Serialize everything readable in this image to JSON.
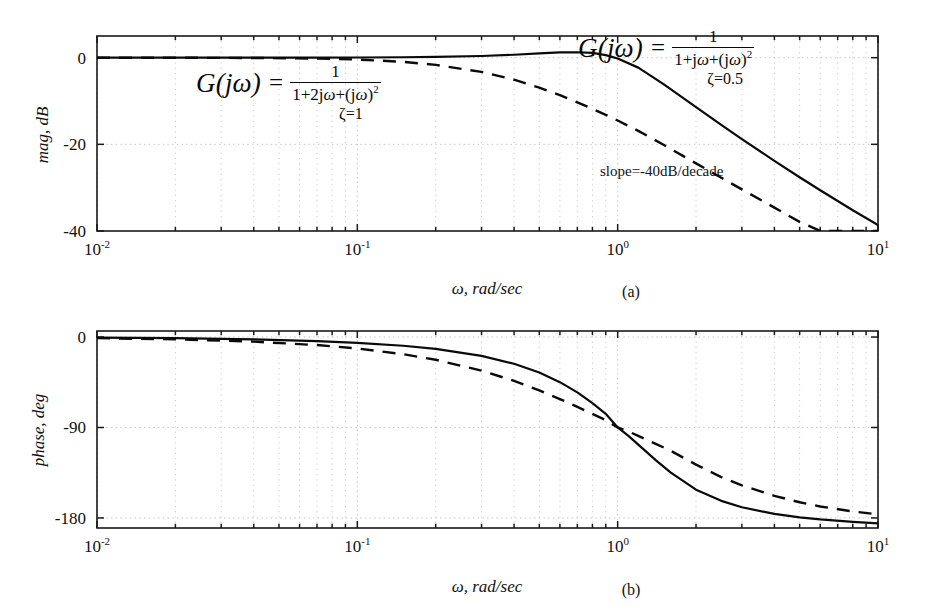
{
  "figure": {
    "caption_a": "(a)",
    "caption_b": "(b)"
  },
  "annotations": {
    "slope_note": "slope=-40dB/decade",
    "formula_left": {
      "lhs": "G(jω)",
      "equals": "=",
      "numerator": "1",
      "denominator_prefix": "1+2j",
      "denominator_omega": "ω",
      "denominator_mid": "+(j",
      "denominator_omega2": "ω",
      "denominator_suffix": ")",
      "denominator_exp": "2",
      "damping": "ζ=1"
    },
    "formula_right": {
      "lhs": "G(jω)",
      "equals": "=",
      "numerator": "1",
      "denominator_prefix": "1+j",
      "denominator_omega": "ω",
      "denominator_mid": "+(j",
      "denominator_omega2": "ω",
      "denominator_suffix": ")",
      "denominator_exp": "2",
      "damping": "ζ=0.5"
    }
  },
  "chart_data": [
    {
      "type": "line",
      "id": "magnitude-plot",
      "title": "",
      "xlabel": "ω, rad/sec",
      "ylabel": "mag, dB",
      "xscale": "log",
      "xlim": [
        0.01,
        10
      ],
      "ylim": [
        -40,
        5
      ],
      "yticks": [
        0,
        -20,
        -40
      ],
      "ytick_labels": [
        "0",
        "-20",
        "-40"
      ],
      "xticks": [
        0.01,
        0.1,
        1,
        10
      ],
      "xtick_labels": [
        "10-2",
        "10-1",
        "100",
        "101"
      ],
      "grid": true,
      "series": [
        {
          "name": "zeta=0.5",
          "style": "solid",
          "x": [
            0.01,
            0.02,
            0.04,
            0.07,
            0.1,
            0.15,
            0.2,
            0.3,
            0.4,
            0.5,
            0.6,
            0.7,
            0.8,
            0.9,
            1.0,
            1.2,
            1.5,
            2.0,
            2.5,
            3.0,
            4.0,
            5.0,
            6.0,
            8.0,
            10.0
          ],
          "y": [
            0.0,
            0.0,
            0.01,
            0.02,
            0.04,
            0.1,
            0.17,
            0.39,
            0.67,
            0.97,
            1.2,
            1.25,
            1.1,
            0.6,
            -0.2,
            -2.3,
            -6.1,
            -11.4,
            -15.5,
            -18.8,
            -23.8,
            -27.6,
            -30.6,
            -35.2,
            -38.6
          ],
          "linewidth": 2.2
        },
        {
          "name": "zeta=1",
          "style": "dashed",
          "x": [
            0.01,
            0.02,
            0.04,
            0.07,
            0.1,
            0.15,
            0.2,
            0.3,
            0.4,
            0.5,
            0.6,
            0.7,
            0.8,
            0.9,
            1.0,
            1.2,
            1.5,
            2.0,
            2.5,
            3.0,
            4.0,
            5.0,
            6.0,
            8.0,
            10.0
          ],
          "y": [
            0.0,
            -0.02,
            -0.07,
            -0.21,
            -0.43,
            -0.96,
            -1.65,
            -3.29,
            -5.09,
            -6.91,
            -8.66,
            -10.3,
            -11.8,
            -13.2,
            -14.5,
            -16.9,
            -20.1,
            -24.4,
            -27.7,
            -30.4,
            -34.6,
            -37.9,
            -40.6,
            -44.9,
            -48.2
          ],
          "linewidth": 2.2
        }
      ]
    },
    {
      "type": "line",
      "id": "phase-plot",
      "title": "",
      "xlabel": "ω, rad/sec",
      "ylabel": "phase, deg",
      "xscale": "log",
      "xlim": [
        0.01,
        10
      ],
      "ylim": [
        -190,
        6
      ],
      "yticks": [
        0,
        -90,
        -180
      ],
      "ytick_labels": [
        "0",
        "-90",
        "-180"
      ],
      "xticks": [
        0.01,
        0.1,
        1,
        10
      ],
      "xtick_labels": [
        "10-2",
        "10-1",
        "100",
        "101"
      ],
      "grid": true,
      "series": [
        {
          "name": "zeta=0.5",
          "style": "solid",
          "x": [
            0.01,
            0.02,
            0.04,
            0.07,
            0.1,
            0.15,
            0.2,
            0.3,
            0.4,
            0.5,
            0.6,
            0.7,
            0.8,
            0.9,
            1.0,
            1.1,
            1.2,
            1.4,
            1.6,
            2.0,
            2.5,
            3.0,
            4.0,
            5.0,
            6.0,
            8.0,
            10.0
          ],
          "y": [
            -0.6,
            -1.1,
            -2.3,
            -4.0,
            -5.8,
            -8.7,
            -11.8,
            -18.8,
            -26.6,
            -35.3,
            -44.9,
            -55.1,
            -65.8,
            -76.4,
            -90.0,
            -98.3,
            -107.0,
            -122.5,
            -134.9,
            -151.9,
            -163.0,
            -169.4,
            -176.0,
            -179.4,
            -181.5,
            -184.0,
            -185.4
          ],
          "linewidth": 2.2
        },
        {
          "name": "zeta=1",
          "style": "dashed",
          "x": [
            0.01,
            0.02,
            0.04,
            0.07,
            0.1,
            0.15,
            0.2,
            0.3,
            0.4,
            0.5,
            0.6,
            0.7,
            0.8,
            0.9,
            1.0,
            1.1,
            1.2,
            1.4,
            1.6,
            2.0,
            2.5,
            3.0,
            4.0,
            5.0,
            6.0,
            8.0,
            10.0
          ],
          "y": [
            -1.1,
            -2.3,
            -4.6,
            -8.0,
            -11.4,
            -17.1,
            -22.6,
            -33.4,
            -43.6,
            -53.1,
            -61.7,
            -69.5,
            -76.4,
            -82.7,
            -90.0,
            -94.0,
            -98.3,
            -106.3,
            -113.2,
            -126.9,
            -139.4,
            -147.5,
            -158.0,
            -164.4,
            -168.6,
            -173.6,
            -176.4
          ],
          "linewidth": 2.2
        }
      ]
    }
  ]
}
